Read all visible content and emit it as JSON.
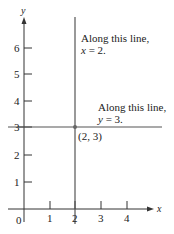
{
  "diagram": {
    "axes": {
      "x_label": "x",
      "y_label": "y",
      "origin_label": "0",
      "x_ticks": [
        "1",
        "2",
        "3",
        "4"
      ],
      "y_ticks": [
        "1",
        "2",
        "3",
        "4",
        "5",
        "6"
      ]
    },
    "vertical_line": {
      "equation_var": "x",
      "value": "2",
      "annotation_line1": "Along this line,",
      "annotation_line2_var": "x",
      "annotation_line2_rest": " = 2."
    },
    "horizontal_line": {
      "equation_var": "y",
      "value": "3",
      "annotation_line1": "Along this line,",
      "annotation_line2_var": "y",
      "annotation_line2_rest": " = 3."
    },
    "intersection_point": {
      "label": "(2, 3)"
    },
    "colors": {
      "axis": "#333333",
      "line": "#555555",
      "text": "#222222"
    }
  }
}
